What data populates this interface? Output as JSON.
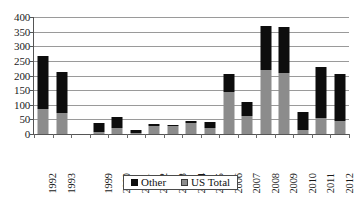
{
  "chart_data": {
    "type": "bar",
    "stacked": true,
    "title": "",
    "subtitle": "",
    "xlabel": "",
    "ylabel": "",
    "ylim": [
      0,
      400
    ],
    "ytick_step": 50,
    "yticks": [
      400,
      350,
      300,
      250,
      200,
      150,
      100,
      50,
      0
    ],
    "grid": true,
    "legend_position": "bottom-center",
    "categories": [
      "1992",
      "1993",
      "",
      "1999",
      "2000",
      "2001",
      "2002",
      "2003",
      "2004",
      "2005",
      "2006",
      "2007",
      "2008",
      "2009",
      "2010",
      "2011",
      "2012"
    ],
    "series": [
      {
        "name": "US Total",
        "color": "#8c8c8c",
        "values": [
          85,
          72,
          0,
          8,
          20,
          3,
          28,
          28,
          37,
          22,
          145,
          62,
          218,
          208,
          14,
          56,
          46
        ]
      },
      {
        "name": "Other",
        "color": "#0d0d0d",
        "values": [
          183,
          140,
          0,
          29,
          38,
          11,
          5,
          4,
          6,
          18,
          60,
          49,
          152,
          157,
          60,
          172,
          160
        ]
      }
    ],
    "totals": [
      268,
      212,
      0,
      37,
      58,
      14,
      33,
      32,
      43,
      40,
      205,
      111,
      370,
      365,
      74,
      228,
      206
    ]
  },
  "legend": {
    "entries": [
      {
        "label": "Other",
        "swatch": "black-square-swatch"
      },
      {
        "label": "US Total",
        "swatch": "gray-square-swatch"
      }
    ]
  },
  "colors": {
    "other": "#0d0d0d",
    "us_total": "#8c8c8c",
    "gridline": "#9a9a9a",
    "axis": "#555555",
    "background": "#ffffff"
  }
}
